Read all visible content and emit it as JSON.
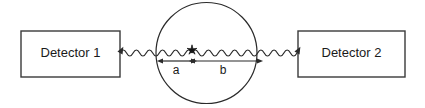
{
  "figure": {
    "type": "physics-schematic",
    "background_color": "#ffffff",
    "line_color": "#2b2b2b",
    "text_color": "#1a1a1a"
  },
  "detector_left": {
    "label": "Detector 1",
    "x": 21,
    "y": 31,
    "width": 99,
    "height": 46
  },
  "detector_right": {
    "label": "Detector 2",
    "x": 298,
    "y": 31,
    "width": 107,
    "height": 46
  },
  "source_region": {
    "name": "circle",
    "center_x": 206.5,
    "center_y": 53,
    "radius": 50.5
  },
  "emission_point": {
    "name": "star",
    "symbol": "*",
    "x": 192,
    "y": 50
  },
  "waves": {
    "left": {
      "x_start": 120,
      "x_end": 192,
      "y": 53,
      "arrow": "left"
    },
    "right": {
      "x_start": 192,
      "x_end": 297,
      "y": 53,
      "arrow": "right"
    },
    "wavelength": 13,
    "amplitude": 3
  },
  "dimensions": [
    {
      "label": "a",
      "x_start": 163,
      "x_end": 191,
      "y": 61,
      "label_x": 176,
      "label_y": 71
    },
    {
      "label": "b",
      "x_start": 195,
      "x_end": 257,
      "y": 61,
      "label_x": 223,
      "label_y": 71
    }
  ]
}
